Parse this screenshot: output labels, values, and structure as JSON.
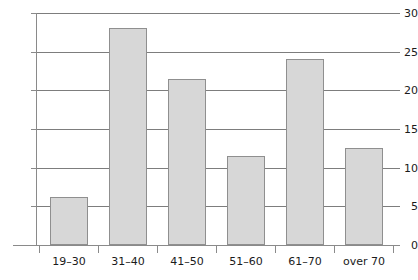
{
  "chart_data": {
    "type": "bar",
    "title": "",
    "subtitle": "",
    "xlabel": "",
    "ylabel": "",
    "categories": [
      "19–30",
      "31–40",
      "41–50",
      "51–60",
      "61–70",
      "over 70"
    ],
    "values": [
      6.2,
      28.0,
      21.5,
      11.5,
      24.0,
      12.6
    ],
    "ylim": [
      0,
      30
    ],
    "y_ticks": [
      0,
      5,
      10,
      15,
      20,
      25,
      30
    ],
    "y_tick_labels": [
      "0",
      "5",
      "10",
      "15",
      "20",
      "25",
      "30"
    ],
    "grid": true,
    "grid_axis": "y",
    "legend": false,
    "legend_position": "none",
    "annotations": [],
    "bar_fill_color": "#d7d7d7",
    "bar_edge_color": "#8f8f8f",
    "grid_color": "#7d7d7d",
    "axis_color": "#8a8a8a",
    "text_color": "#1b1b1b",
    "background_color": "#ffffff"
  }
}
